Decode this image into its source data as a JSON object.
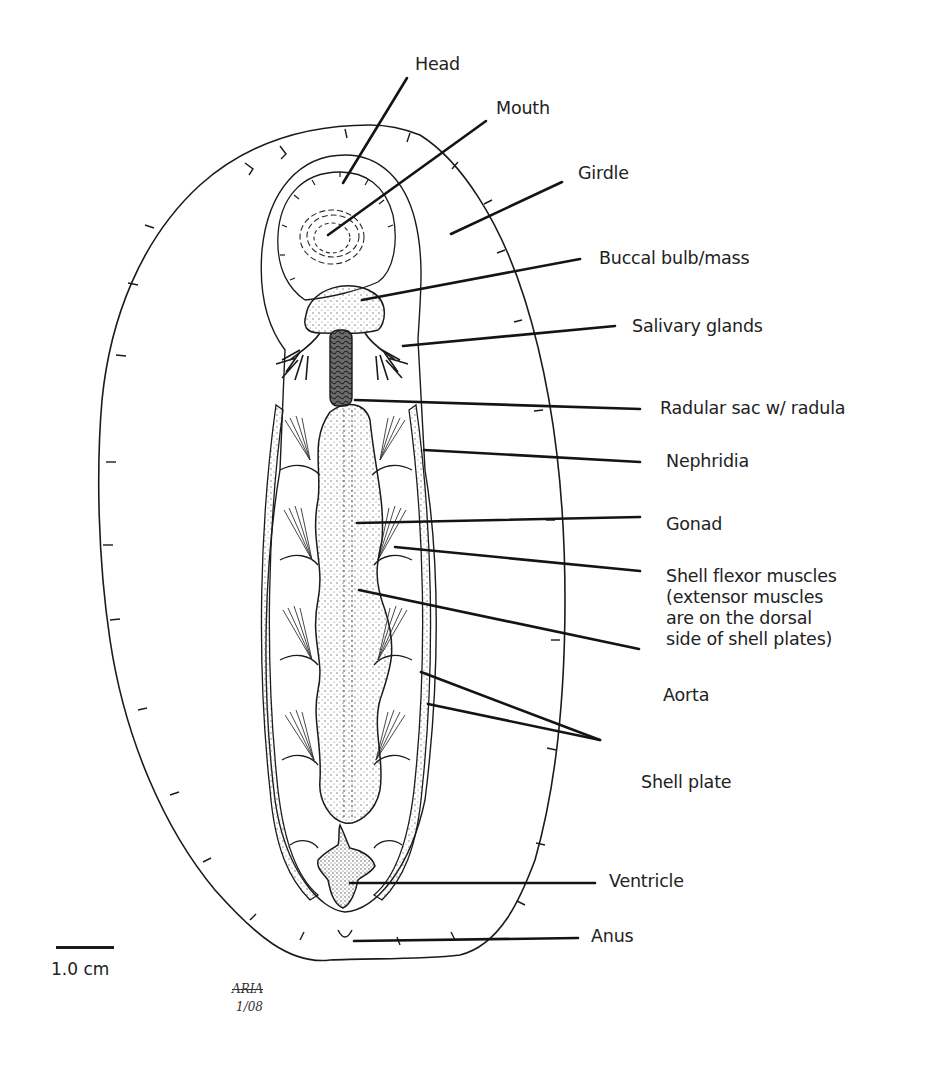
{
  "diagram": {
    "labels": [
      {
        "id": "head",
        "text": "Head"
      },
      {
        "id": "mouth",
        "text": "Mouth"
      },
      {
        "id": "girdle",
        "text": "Girdle"
      },
      {
        "id": "buccal",
        "text": "Buccal bulb/mass"
      },
      {
        "id": "salivary",
        "text": "Salivary glands"
      },
      {
        "id": "radular",
        "text": "Radular sac w/ radula"
      },
      {
        "id": "nephridia",
        "text": "Nephridia"
      },
      {
        "id": "gonad",
        "text": "Gonad"
      },
      {
        "id": "shell_flexor",
        "text": "Shell flexor muscles\n(extensor muscles\nare on the dorsal\nside of shell plates)"
      },
      {
        "id": "aorta",
        "text": "Aorta"
      },
      {
        "id": "shell_plate",
        "text": "Shell plate"
      },
      {
        "id": "ventricle",
        "text": "Ventricle"
      },
      {
        "id": "anus",
        "text": "Anus"
      }
    ],
    "scale_bar": {
      "label": "1.0 cm"
    },
    "signature": {
      "name": "ARIA",
      "date": "1/08"
    },
    "colors": {
      "ink": "#1b1b1b",
      "background": "#ffffff",
      "stipple": "#555555"
    }
  }
}
